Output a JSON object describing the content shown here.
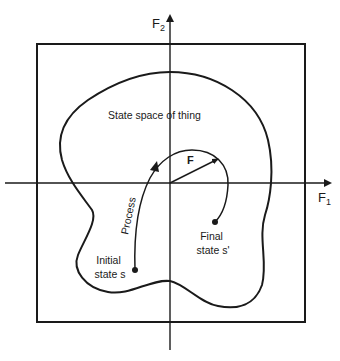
{
  "diagram": {
    "axes": {
      "x_label": "F",
      "x_subscript": "1",
      "y_label": "F",
      "y_subscript": "2"
    },
    "region_label": "State space of thing",
    "vector_label": "F",
    "process_label": "Process",
    "initial_state": {
      "line1": "Initial",
      "line2": "state s"
    },
    "final_state": {
      "line1": "Final",
      "line2": "state s'"
    },
    "colors": {
      "stroke": "#1a1a1a",
      "background": "#ffffff"
    }
  }
}
